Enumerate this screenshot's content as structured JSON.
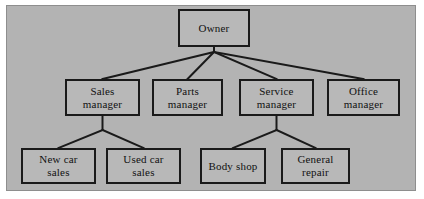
{
  "diagram": {
    "type": "organizational-chart",
    "title": "Owner",
    "panel_color": "#b3b3b3",
    "node_fill": "#b8b8b8",
    "line_color": "#1a1a1a",
    "levels": 3,
    "nodes": [
      {
        "id": "owner",
        "label": "Owner",
        "line1": "Owner",
        "line2": "",
        "level": 1,
        "x": 178,
        "y": 9,
        "w": 72,
        "h": 38
      },
      {
        "id": "sales-mgr",
        "label": "Sales manager",
        "line1": "Sales",
        "line2": "manager",
        "level": 2,
        "x": 65,
        "y": 79,
        "w": 75,
        "h": 37
      },
      {
        "id": "parts-mgr",
        "label": "Parts manager",
        "line1": "Parts",
        "line2": "manager",
        "level": 2,
        "x": 152,
        "y": 79,
        "w": 71,
        "h": 37
      },
      {
        "id": "service-mgr",
        "label": "Service manager",
        "line1": "Service",
        "line2": "manager",
        "level": 2,
        "x": 239,
        "y": 79,
        "w": 75,
        "h": 37
      },
      {
        "id": "office-mgr",
        "label": "Office manager",
        "line1": "Office",
        "line2": "manager",
        "level": 2,
        "x": 327,
        "y": 79,
        "w": 73,
        "h": 37
      },
      {
        "id": "new-car",
        "label": "New car sales",
        "line1": "New car",
        "line2": "sales",
        "level": 3,
        "x": 21,
        "y": 148,
        "w": 75,
        "h": 36
      },
      {
        "id": "used-car",
        "label": "Used car sales",
        "line1": "Used car",
        "line2": "sales",
        "level": 3,
        "x": 106,
        "y": 148,
        "w": 75,
        "h": 36
      },
      {
        "id": "body-shop",
        "label": "Body shop",
        "line1": "Body shop",
        "line2": "",
        "level": 3,
        "x": 200,
        "y": 148,
        "w": 66,
        "h": 36
      },
      {
        "id": "general-rep",
        "label": "General repair",
        "line1": "General",
        "line2": "repair",
        "level": 3,
        "x": 281,
        "y": 148,
        "w": 69,
        "h": 36
      }
    ],
    "edges": [
      {
        "from": "owner",
        "to": "sales-mgr"
      },
      {
        "from": "owner",
        "to": "parts-mgr"
      },
      {
        "from": "owner",
        "to": "service-mgr"
      },
      {
        "from": "owner",
        "to": "office-mgr"
      },
      {
        "from": "sales-mgr",
        "to": "new-car"
      },
      {
        "from": "sales-mgr",
        "to": "used-car"
      },
      {
        "from": "service-mgr",
        "to": "body-shop"
      },
      {
        "from": "service-mgr",
        "to": "general-rep"
      }
    ]
  }
}
